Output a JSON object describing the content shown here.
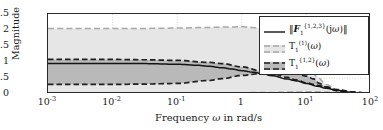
{
  "figure": {
    "background": "#ffffff",
    "frame_color": "#2b2b2b"
  },
  "axes": {
    "ylabel": "Magnitude",
    "xlabel_parts": {
      "pre": "Frequency ",
      "symbol": "ω",
      "post": " in rad/s"
    },
    "xlabel_full": "Frequency ω in rad/s",
    "yticks": [
      "0",
      "0.5",
      "1",
      "1.5",
      "2",
      "2.5"
    ],
    "ytick_values": [
      0,
      0.5,
      1,
      1.5,
      2,
      2.5
    ],
    "ylim": [
      0,
      2.5
    ],
    "xticks": [
      {
        "label_base": "10",
        "label_exp": "-3",
        "value": 0.001
      },
      {
        "label_base": "10",
        "label_exp": "-2",
        "value": 0.01
      },
      {
        "label_base": "10",
        "label_exp": "-1",
        "value": 0.1
      },
      {
        "label_base": "1",
        "label_exp": "",
        "value": 1
      },
      {
        "label_base": "10",
        "label_exp": "1",
        "value": 10
      },
      {
        "label_base": "10",
        "label_exp": "2",
        "value": 100
      }
    ],
    "xlim": [
      0.001,
      100
    ],
    "xscale": "log",
    "grid": true,
    "grid_color": "#b9b9b9"
  },
  "legend": {
    "position": "top-right",
    "border_color": "#2b2b2b",
    "entries": [
      {
        "id": "F1",
        "key_style": "solid",
        "color": "#141414",
        "text_html": "‖<span class=\"bold-it\">F</span><sub>1</sub><sup>{1,2,3}</sup>(j<span class=\"it\">ω</span>)‖",
        "text_plain": "||F_1^{1,2,3}(jω)||"
      },
      {
        "id": "T1_1",
        "key_style": "dashed-band",
        "color": "#a8a8a8",
        "band_color": "#e3e3e3",
        "text_html": "<span class=\"up\">T</span><sub>1</sub><sup>(1)</sup>(<span class=\"it\">ω</span>)",
        "text_plain": "T_1^{(1)}(ω)"
      },
      {
        "id": "T1_12",
        "key_style": "dashed-band",
        "color": "#1f1f1f",
        "band_color": "#b8b8b8",
        "text_html": "<span class=\"up\">T</span><sub>1</sub><sup>{1,2}</sup>(<span class=\"it\">ω</span>)",
        "text_plain": "T_1^{(1,2)}(ω)"
      }
    ]
  },
  "chart_data": {
    "type": "line",
    "title": "",
    "xlabel": "Frequency ω in rad/s",
    "ylabel": "Magnitude",
    "xscale": "log",
    "xlim": [
      0.001,
      100
    ],
    "ylim": [
      0,
      2.5
    ],
    "grid": true,
    "legend_position": "top-right",
    "bands": [
      {
        "name": "T_1^{(1)}(ω)",
        "fill": "#e6e6e6",
        "edge_color": "#a8a8a8",
        "style": "dashed",
        "x": [
          0.001,
          0.01,
          0.03,
          0.1,
          0.3,
          0.5,
          1,
          2,
          3,
          5,
          7,
          10,
          15,
          20,
          30,
          50,
          100
        ],
        "upper": [
          2.05,
          2.05,
          2.05,
          2.06,
          2.08,
          2.09,
          2.1,
          2.06,
          1.98,
          1.72,
          1.42,
          1.0,
          0.52,
          0.3,
          0.12,
          0.04,
          0.01
        ],
        "lower": [
          0.02,
          0.02,
          0.02,
          0.02,
          0.03,
          0.03,
          0.04,
          0.05,
          0.05,
          0.06,
          0.06,
          0.07,
          0.07,
          0.06,
          0.05,
          0.03,
          0.01
        ]
      },
      {
        "name": "T_1^{(1,2)}(ω)",
        "fill": "#b9b9b9",
        "edge_color": "#1f1f1f",
        "style": "dashed",
        "x": [
          0.001,
          0.01,
          0.03,
          0.1,
          0.3,
          0.5,
          1,
          2,
          3,
          5,
          7,
          10,
          13,
          16,
          20,
          30,
          50,
          100
        ],
        "upper": [
          1.08,
          1.08,
          1.07,
          1.05,
          0.99,
          0.95,
          0.85,
          0.72,
          0.64,
          0.52,
          0.44,
          0.35,
          0.3,
          0.26,
          0.22,
          0.14,
          0.07,
          0.02
        ],
        "lower": [
          0.3,
          0.3,
          0.31,
          0.33,
          0.42,
          0.48,
          0.58,
          0.64,
          0.66,
          0.66,
          0.63,
          0.56,
          0.47,
          0.33,
          0.22,
          0.1,
          0.04,
          0.01
        ]
      }
    ],
    "series": [
      {
        "name": "||F_1^{1,2,3}(jω)||",
        "color": "#141414",
        "style": "solid",
        "x": [
          0.001,
          0.01,
          0.03,
          0.1,
          0.2,
          0.3,
          0.5,
          0.7,
          1,
          1.5,
          2,
          3,
          5,
          7,
          10,
          15,
          20,
          30,
          50,
          70,
          100
        ],
        "y": [
          0.95,
          0.95,
          0.95,
          0.93,
          0.9,
          0.87,
          0.82,
          0.78,
          0.73,
          0.68,
          0.64,
          0.57,
          0.47,
          0.41,
          0.33,
          0.24,
          0.18,
          0.11,
          0.05,
          0.03,
          0.01
        ]
      }
    ]
  }
}
